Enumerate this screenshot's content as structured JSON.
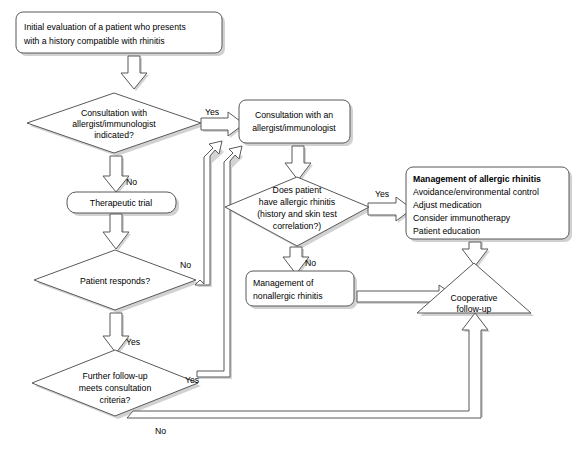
{
  "diagram": {
    "type": "flowchart",
    "nodes": {
      "start": {
        "shape": "rounded-rectangle",
        "line1": "Initial evaluation of a patient who presents",
        "line2": "with a history compatible with rhinitis"
      },
      "consult_indicated": {
        "shape": "diamond",
        "line1": "Consultation with",
        "line2": "allergist/immunologist",
        "line3": "indicated?"
      },
      "consult_allergist": {
        "shape": "rounded-rectangle",
        "line1": "Consultation with an",
        "line2": "allergist/immunologist"
      },
      "therapeutic_trial": {
        "shape": "rounded-rectangle",
        "line1": "Therapeutic trial"
      },
      "patient_responds": {
        "shape": "diamond",
        "line1": "Patient responds?"
      },
      "has_allergic_rhinitis": {
        "shape": "diamond",
        "line1": "Does patient",
        "line2": "have allergic rhinitis",
        "line3": "(history and skin test",
        "line4": "correlation?)"
      },
      "mgmt_allergic": {
        "shape": "rounded-rectangle",
        "heading": "Management of allergic rhinitis",
        "item1": "Avoidance/environmental control",
        "item2": "Adjust medication",
        "item3": "Consider immunotherapy",
        "item4": "Patient education"
      },
      "mgmt_nonallergic": {
        "shape": "rounded-rectangle",
        "line1": "Management of",
        "line2": "nonallergic rhinitis"
      },
      "further_followup": {
        "shape": "diamond",
        "line1": "Further follow-up",
        "line2": "meets consultation",
        "line3": "criteria?"
      },
      "cooperative_followup": {
        "shape": "triangle",
        "line1": "Cooperative",
        "line2": "follow-up"
      }
    },
    "edge_labels": {
      "consult_yes": "Yes",
      "consult_no": "No",
      "responds_no": "No",
      "responds_yes": "Yes",
      "allergic_yes": "Yes",
      "allergic_no": "No",
      "followup_yes": "Yes",
      "followup_no": "No"
    },
    "colors": {
      "stroke": "#595959",
      "fill": "#ffffff",
      "shadow": "#c9c9c9",
      "text": "#000000",
      "background": "#ffffff"
    }
  }
}
